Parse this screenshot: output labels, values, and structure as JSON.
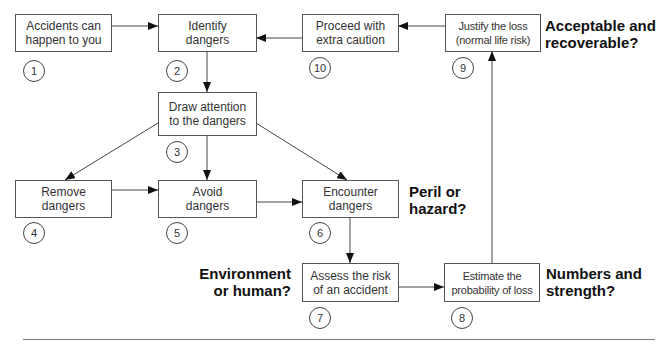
{
  "diagram": {
    "type": "flowchart",
    "nodes": [
      {
        "id": 1,
        "label": "Accidents can\nhappen to you",
        "number": "1"
      },
      {
        "id": 2,
        "label": "Identify\ndangers",
        "number": "2"
      },
      {
        "id": 3,
        "label": "Draw attention\nto the dangers",
        "number": "3"
      },
      {
        "id": 4,
        "label": "Remove\ndangers",
        "number": "4"
      },
      {
        "id": 5,
        "label": "Avoid\ndangers",
        "number": "5"
      },
      {
        "id": 6,
        "label": "Encounter\ndangers",
        "number": "6"
      },
      {
        "id": 7,
        "label": "Assess the risk\nof an accident",
        "number": "7"
      },
      {
        "id": 8,
        "label": "Estimate the\nprobability of loss",
        "number": "8"
      },
      {
        "id": 9,
        "label": "Justify the loss\n(normal life risk)",
        "number": "9"
      },
      {
        "id": 10,
        "label": "Proceed with\nextra caution",
        "number": "10"
      }
    ],
    "edges": [
      {
        "from": 1,
        "to": 2
      },
      {
        "from": 2,
        "to": 3
      },
      {
        "from": 3,
        "to": 4
      },
      {
        "from": 3,
        "to": 5
      },
      {
        "from": 3,
        "to": 6
      },
      {
        "from": 4,
        "to": 5
      },
      {
        "from": 5,
        "to": 6
      },
      {
        "from": 6,
        "to": 7
      },
      {
        "from": 7,
        "to": 8
      },
      {
        "from": 8,
        "to": 9
      },
      {
        "from": 9,
        "to": 10
      },
      {
        "from": 10,
        "to": 2
      }
    ],
    "questions": {
      "peril": "Peril or\nhazard?",
      "environment": "Environment\nor human?",
      "numbers": "Numbers and\nstrength?",
      "acceptable": "Acceptable and\nrecoverable?"
    }
  }
}
